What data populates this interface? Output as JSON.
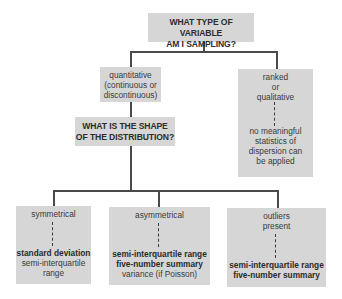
{
  "title_question": {
    "line1": "WHAT TYPE OF VARIABLE",
    "line2": "AM I SAMPLING?"
  },
  "quantitative": {
    "line1": "quantitative",
    "line2": "(continuous or",
    "line3": "discontinuous)"
  },
  "ranked": {
    "line1": "ranked",
    "line2": "or",
    "line3": "qualitative",
    "result1": "no meaningful",
    "result2": "statistics of",
    "result3": "dispersion can",
    "result4": "be applied"
  },
  "shape_question": {
    "line1": "WHAT IS THE SHAPE",
    "line2": "OF THE DISTRIBUTION?"
  },
  "symmetrical": {
    "label": "symmetrical",
    "result_bold1": "standard deviation",
    "result2": "semi-interquartile",
    "result3": "range"
  },
  "asymmetrical": {
    "label": "asymmetrical",
    "result_bold1": "semi-interquartile range",
    "result_bold2": "five-number summary",
    "result3": "variance (if Poisson)"
  },
  "outliers": {
    "label1": "outliers",
    "label2": "present",
    "result_bold1": "semi-interquartile range",
    "result_bold2": "five-number summary"
  },
  "colors": {
    "box_fill": "#d6d6d6",
    "connector": "#4a4a4a"
  }
}
